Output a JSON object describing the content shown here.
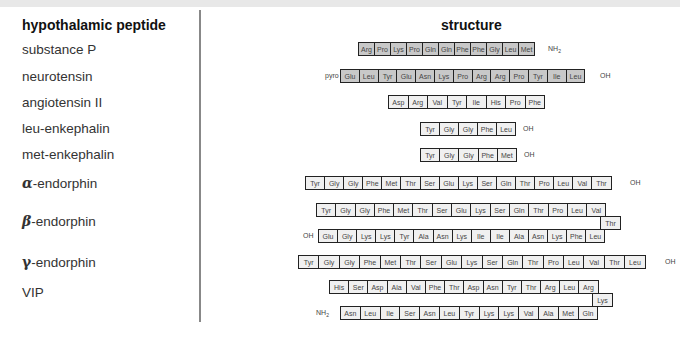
{
  "header": {
    "left": "hypothalamic peptide",
    "right": "structure"
  },
  "peptides": [
    {
      "name": "substance P",
      "sequence": [
        "Arg",
        "Pro",
        "Lys",
        "Pro",
        "Gln",
        "Gln",
        "Phe",
        "Phe",
        "Gly",
        "Leu",
        "Met"
      ],
      "c_term": "NH",
      "c_term_sub": "2"
    },
    {
      "name": "neurotensin",
      "n_term": "pyro",
      "sequence": [
        "Glu",
        "Leu",
        "Tyr",
        "Glu",
        "Asn",
        "Lys",
        "Pro",
        "Arg",
        "Arg",
        "Pro",
        "Tyr",
        "Ile",
        "Leu"
      ],
      "c_term": "OH"
    },
    {
      "name": "angiotensin II",
      "sequence": [
        "Asp",
        "Arg",
        "Val",
        "Tyr",
        "Ile",
        "His",
        "Pro",
        "Phe"
      ]
    },
    {
      "name": "leu-enkephalin",
      "sequence": [
        "Tyr",
        "Gly",
        "Gly",
        "Phe",
        "Leu"
      ],
      "c_term": "OH"
    },
    {
      "name": "met-enkephalin",
      "sequence": [
        "Tyr",
        "Gly",
        "Gly",
        "Phe",
        "Met"
      ],
      "c_term": "OH"
    },
    {
      "name_prefix": "α",
      "name": "-endorphin",
      "sequence": [
        "Tyr",
        "Gly",
        "Gly",
        "Phe",
        "Met",
        "Thr",
        "Ser",
        "Glu",
        "Lys",
        "Ser",
        "Gln",
        "Thr",
        "Pro",
        "Leu",
        "Val",
        "Thr"
      ],
      "c_term": "OH"
    },
    {
      "name_prefix": "β",
      "name": "-endorphin",
      "row1": [
        "Tyr",
        "Gly",
        "Gly",
        "Phe",
        "Met",
        "Thr",
        "Ser",
        "Glu",
        "Lys",
        "Ser",
        "Gln",
        "Thr",
        "Pro",
        "Leu",
        "Val"
      ],
      "turn": "Thr",
      "row3": [
        "Glu",
        "Gly",
        "Lys",
        "Lys",
        "Tyr",
        "Ala",
        "Asn",
        "Lys",
        "Ile",
        "Ile",
        "Ala",
        "Asn",
        "Lys",
        "Phe",
        "Leu"
      ],
      "c_term": "OH"
    },
    {
      "name_prefix": "γ",
      "name": "-endorphin",
      "sequence": [
        "Tyr",
        "Gly",
        "Gly",
        "Phe",
        "Met",
        "Thr",
        "Ser",
        "Glu",
        "Lys",
        "Ser",
        "Gln",
        "Thr",
        "Pro",
        "Leu",
        "Val",
        "Thr",
        "Leu"
      ],
      "c_term": "OH"
    },
    {
      "name": "VIP",
      "row1": [
        "His",
        "Ser",
        "Asp",
        "Ala",
        "Val",
        "Phe",
        "Thr",
        "Asp",
        "Asn",
        "Tyr",
        "Thr",
        "Arg",
        "Leu",
        "Arg"
      ],
      "turn": "Lys",
      "row3": [
        "Asn",
        "Leu",
        "Ile",
        "Ser",
        "Asn",
        "Leu",
        "Tyr",
        "Lys",
        "Lys",
        "Val",
        "Ala",
        "Met",
        "Gln"
      ],
      "c_term": "NH",
      "c_term_sub": "2"
    }
  ],
  "colors": {
    "shaded_box": "#c8c8c8",
    "plain_box": "#f0f0f0",
    "border": "#222222"
  }
}
